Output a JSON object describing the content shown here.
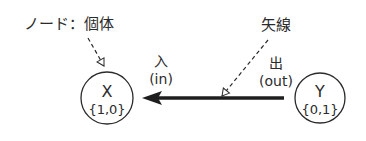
{
  "diagram": {
    "node_label": "ノード：個体",
    "edge_label": "矢線",
    "in_label": "入",
    "in_label_en": "(in)",
    "out_label": "出",
    "out_label_en": "(out)",
    "nodes": [
      {
        "name": "X",
        "values": "{1,0}"
      },
      {
        "name": "Y",
        "values": "{0,1}"
      }
    ],
    "colors": {
      "stroke": "#2b2b2b",
      "background": "#ffffff"
    }
  }
}
